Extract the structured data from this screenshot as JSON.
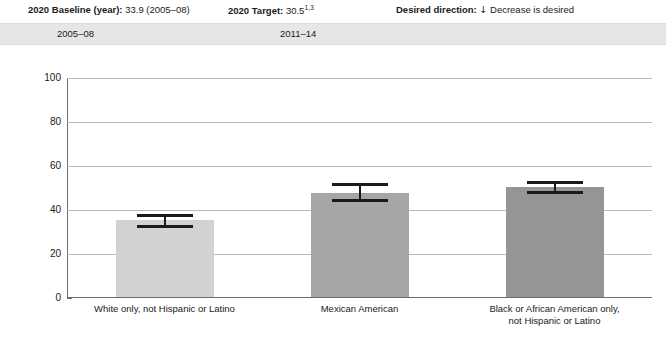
{
  "header": {
    "baseline_label": "2020 Baseline (year):",
    "baseline_value": "33.9 (2005–08)",
    "target_label": "2020 Target:",
    "target_value": "30.5",
    "target_footnote": "1,3",
    "direction_label": "Desired direction:",
    "direction_arrow": "↓",
    "direction_value": "Decrease is desired"
  },
  "periods": [
    {
      "label": "2005–08"
    },
    {
      "label": "2011–14"
    }
  ],
  "chart_data": {
    "type": "bar",
    "title": "",
    "subtitle": "",
    "xlabel": "",
    "ylabel": "percent",
    "ylim": [
      0,
      100
    ],
    "yticks": [
      0,
      20,
      40,
      60,
      80,
      100
    ],
    "ytick_labels": [
      "0",
      "20",
      "40",
      "60",
      "80",
      "100"
    ],
    "grid": true,
    "legend": "none",
    "categories": [
      "White only, not Hispanic or Latino",
      "Mexican American",
      "Black or African American only, not Hispanic or Latino"
    ],
    "category_lines": [
      [
        "White only, not Hispanic or Latino"
      ],
      [
        "Mexican American"
      ],
      [
        "Black or African American only,",
        "not Hispanic or Latino"
      ]
    ],
    "values": [
      34.8,
      47.3,
      50.0
    ],
    "error_low": [
      32.2,
      44.0,
      47.8
    ],
    "error_high": [
      37.2,
      51.5,
      52.5
    ],
    "bar_colors": [
      "#d2d2d2",
      "#a6a6a6",
      "#959595"
    ]
  }
}
